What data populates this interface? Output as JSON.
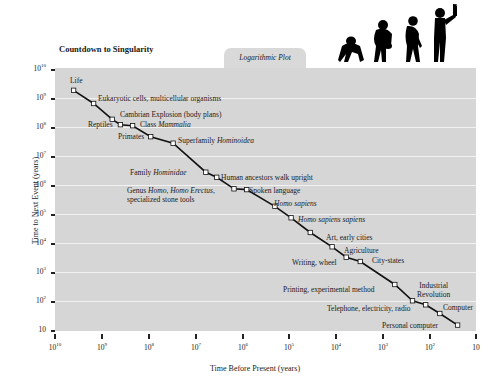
{
  "chart_data": {
    "type": "line",
    "title": "Countdown to Singularity",
    "subtitle": "Logarithmic Plot",
    "xlabel": "Time Before Present (years)",
    "ylabel": "Time to Next Event (years)",
    "x_scale": "log",
    "y_scale": "log",
    "x_reversed": true,
    "xlim": [
      10000000000.0,
      10
    ],
    "ylim": [
      10,
      10000000000.0
    ],
    "grid": "horizontal",
    "x_ticks": [
      "10^10",
      "10^9",
      "10^8",
      "10^7",
      "10^6",
      "10^5",
      "10^4",
      "10^3",
      "10^2",
      "10"
    ],
    "y_ticks": [
      "10^10",
      "10^9",
      "10^8",
      "10^7",
      "10^6",
      "10^5",
      "10^4",
      "10^3",
      "10^2",
      "10"
    ],
    "series": [
      {
        "name": "Canonical milestones",
        "points": [
          {
            "label": "Life",
            "x": 4000000000.0,
            "y": 2000000000.0
          },
          {
            "label": "Eukaryotic cells, multicellular organisms",
            "x": 1500000000.0,
            "y": 700000000.0
          },
          {
            "label": "Cambrian Explosion (body plans)",
            "x": 600000000.0,
            "y": 200000000.0
          },
          {
            "label": "Reptiles",
            "x": 400000000.0,
            "y": 130000000.0
          },
          {
            "label": "Class Mammalia",
            "x": 220000000.0,
            "y": 120000000.0
          },
          {
            "label": "Primates",
            "x": 90000000.0,
            "y": 50000000.0
          },
          {
            "label": "Superfamily Hominoidea",
            "x": 30000000.0,
            "y": 30000000.0
          },
          {
            "label": "Family Hominidae",
            "x": 6000000.0,
            "y": 3000000.0
          },
          {
            "label": "Human ancestors walk upright",
            "x": 3500000.0,
            "y": 2000000.0
          },
          {
            "label": "Genus Homo, Homo Erectus, specialized stone tools",
            "x": 1500000.0,
            "y": 800000.0
          },
          {
            "label": "Spoken language",
            "x": 800000.0,
            "y": 750000.0
          },
          {
            "label": "Homo sapiens",
            "x": 200000.0,
            "y": 200000.0
          },
          {
            "label": "Homo sapiens sapiens",
            "x": 90000.0,
            "y": 80000.0
          },
          {
            "label": "Art, early cities",
            "x": 35000.0,
            "y": 25000.0
          },
          {
            "label": "Agriculture",
            "x": 12000.0,
            "y": 8000.0
          },
          {
            "label": "Writing, wheel",
            "x": 6000.0,
            "y": 3500.0
          },
          {
            "label": "City-states",
            "x": 3000.0,
            "y": 2500.0
          },
          {
            "label": "Printing, experimental method",
            "x": 550.0,
            "y": 400.0
          },
          {
            "label": "Industrial Revolution",
            "x": 230.0,
            "y": 110.0
          },
          {
            "label": "Telephone, electricity, radio",
            "x": 120.0,
            "y": 80
          },
          {
            "label": "Computer",
            "x": 60,
            "y": 40
          },
          {
            "label": "Personal computer",
            "x": 25,
            "y": 16
          }
        ]
      }
    ]
  },
  "header": {
    "title": "Countdown to Singularity",
    "tab_label": "Logarithmic Plot"
  },
  "axes": {
    "x_title": "Time Before Present (years)",
    "y_title": "Time to Next Event (years)"
  },
  "decoration": {
    "image": "evolution-of-man-silhouette"
  },
  "colors": {
    "plot_bg": "#d6d6d6",
    "gridline": "#f2f2f2",
    "line": "#111111",
    "marker_fill": "#ffffff"
  }
}
